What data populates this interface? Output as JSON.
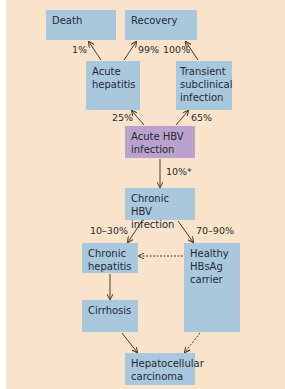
{
  "diagram": {
    "nodes": {
      "death": "Death",
      "recovery": "Recovery",
      "acute_hepatitis_1": "Acute",
      "acute_hepatitis_2": "hepatitis",
      "transient_1": "Transient",
      "transient_2": "subclinical",
      "transient_3": "infection",
      "acute_hbv_1": "Acute HBV",
      "acute_hbv_2": "infection",
      "chronic_hbv_1": "Chronic HBV",
      "chronic_hbv_2": "infection",
      "chronic_hepatitis_1": "Chronic",
      "chronic_hepatitis_2": "hepatitis",
      "carrier_1": "Healthy",
      "carrier_2": "HBsAg",
      "carrier_3": "carrier",
      "cirrhosis": "Cirrhosis",
      "hcc_1": "Hepatocellular",
      "hcc_2": "carcinoma"
    },
    "edges": {
      "acute_hepatitis_to_death": "1%",
      "acute_hepatitis_to_recovery": "99%",
      "transient_to_recovery": "100%",
      "acute_hbv_to_acute_hepatitis": "25%",
      "acute_hbv_to_transient": "65%",
      "acute_hbv_to_chronic": "10%*",
      "chronic_to_chronic_hepatitis": "10–30%",
      "chronic_to_carrier": "70–90%"
    },
    "colors": {
      "background": "#f9e3cb",
      "box_blue": "#a9c8dd",
      "box_purple": "#b9a3cc",
      "arrow": "#4a3a2e"
    }
  }
}
